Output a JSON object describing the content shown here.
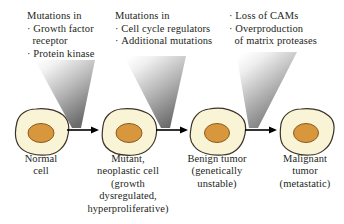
{
  "figure": {
    "background_color": "#ffffff",
    "text_color": "#231f20",
    "cell_fill_color": "#faf4d7",
    "cell_stroke_color": "#3a3226",
    "nucleus_fill_color": "#d8973c",
    "nucleus_stroke_color": "#8a5a20",
    "wedge_color_light": "#ffffff",
    "wedge_color_dark": "#6f6f6f",
    "arrow_color": "#000000"
  },
  "annotations": [
    {
      "id": "mutations-growth-factor",
      "header": "Mutations in",
      "bullets": [
        {
          "text": "Growth factor",
          "continuation": "receptor"
        },
        {
          "text": "Protein kinase",
          "continuation": ""
        }
      ]
    },
    {
      "id": "mutations-cell-cycle",
      "header": "Mutations in",
      "bullets": [
        {
          "text": "Cell cycle regulators",
          "continuation": ""
        },
        {
          "text": "Additional mutations",
          "continuation": ""
        }
      ]
    },
    {
      "id": "loss-of-cams",
      "header": "",
      "bullets": [
        {
          "text": "Loss of CAMs",
          "continuation": ""
        },
        {
          "text": "Overproduction",
          "continuation": "of matrix proteases"
        }
      ]
    }
  ],
  "stages": [
    {
      "id": "normal-cell",
      "caption_lines": [
        "Normal",
        "cell"
      ]
    },
    {
      "id": "mutant-neoplastic-cell",
      "caption_lines": [
        "Mutant,",
        "neoplastic cell",
        "(growth",
        "dysregulated,",
        "hyperproliferative)"
      ]
    },
    {
      "id": "benign-tumor",
      "caption_lines": [
        "Benign tumor",
        "(genetically",
        "unstable)"
      ]
    },
    {
      "id": "malignant-tumor",
      "caption_lines": [
        "Malignant",
        "tumor",
        "(metastatic)"
      ]
    }
  ],
  "arrows": [
    {
      "id": "arrow-normal-to-mutant",
      "glyph": "arrow-right-icon"
    },
    {
      "id": "arrow-mutant-to-benign",
      "glyph": "arrow-right-icon"
    },
    {
      "id": "arrow-benign-to-malignant",
      "glyph": "arrow-right-icon"
    }
  ]
}
